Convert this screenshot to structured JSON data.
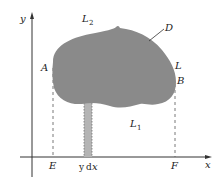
{
  "figure": {
    "axes": {
      "x_label": "x",
      "y_label": "y"
    },
    "points": {
      "A": "A",
      "B": "B",
      "E": "E",
      "F": "F"
    },
    "curves": {
      "L": "L",
      "L1_main": "L",
      "L1_sub": "1",
      "L2_main": "L",
      "L2_sub": "2"
    },
    "region_label": "D",
    "strip_label_y": "y",
    "strip_label_d": "d",
    "strip_label_x": "x",
    "colors": {
      "region_fill": "#8a8a8a",
      "strip_fill": "#b4b4b4",
      "axis": "#333333",
      "dashed": "#555555"
    }
  }
}
